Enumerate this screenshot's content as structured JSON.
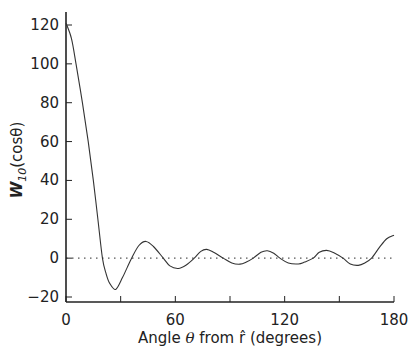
{
  "chart_data": {
    "type": "line",
    "title": "",
    "xlabel": "Angle θ from r̂ (degrees)",
    "ylabel": "W_10(cosθ)",
    "ylabel_parts": {
      "main": "W",
      "sub": "10",
      "rest": "(cosθ)"
    },
    "xlabel_parts": {
      "pre": "Angle ",
      "theta": "θ",
      "mid": " from ",
      "rhat": "r̂",
      "post": " (degrees)"
    },
    "xlim": [
      0,
      180
    ],
    "ylim": [
      -20,
      120
    ],
    "x_ticks": [
      0,
      30,
      60,
      90,
      120,
      150,
      180
    ],
    "x_tick_labels": [
      "0",
      "",
      "60",
      "",
      "120",
      "",
      "180"
    ],
    "y_ticks": [
      -20,
      0,
      20,
      40,
      60,
      80,
      100,
      120
    ],
    "y_tick_labels": [
      "−20",
      "0",
      "20",
      "40",
      "60",
      "80",
      "100",
      "120"
    ],
    "grid": false,
    "reference_line": {
      "y": 0,
      "style": "dotted"
    },
    "series": [
      {
        "name": "W_10(cosθ)",
        "x": [
          0,
          3,
          5.5,
          9,
          12.2,
          15,
          17.5,
          20,
          22,
          24,
          27.3,
          31,
          33.5,
          36,
          40,
          43.9,
          48,
          53.4,
          57,
          61.6,
          66,
          70.4,
          74,
          77.2,
          81,
          86.3,
          91,
          95.5,
          99,
          102.8,
          107,
          110.5,
          114,
          117.4,
          122,
          127.5,
          131,
          135.7,
          139,
          143,
          147,
          152,
          156,
          160.4,
          164,
          167.7,
          172,
          176,
          180
        ],
        "values": [
          121,
          113,
          100,
          80,
          60,
          40,
          20,
          0,
          -8,
          -13,
          -16.1,
          -10,
          -5,
          0,
          6.5,
          8.6,
          6,
          0,
          -4,
          -5.3,
          -3.5,
          0,
          3.5,
          4.5,
          3,
          0,
          -2.5,
          -3.1,
          -2,
          0,
          3,
          3.8,
          2.5,
          0,
          -2.5,
          -3,
          -2,
          0,
          3,
          4,
          2.8,
          0,
          -3,
          -3.7,
          -2.5,
          0,
          5.5,
          10,
          11.8
        ]
      }
    ]
  }
}
